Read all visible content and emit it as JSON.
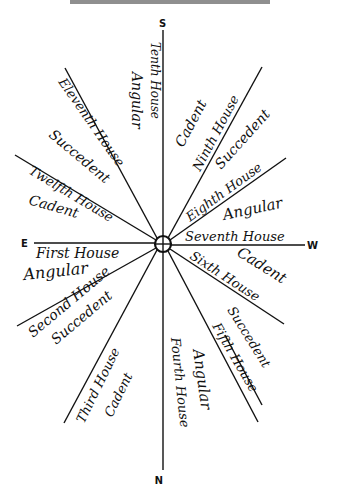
{
  "header": {
    "text": ""
  },
  "compass": {
    "south": "S",
    "north": "N",
    "east": "E",
    "west": "W"
  },
  "houses": [
    {
      "name": "First House",
      "type": "Angular"
    },
    {
      "name": "Second House",
      "type": "Succedent"
    },
    {
      "name": "Third House",
      "type": "Cadent"
    },
    {
      "name": "Fourth House",
      "type": "Angular"
    },
    {
      "name": "Fifth House",
      "type": "Succedent"
    },
    {
      "name": "Sixth House",
      "type": "Cadent"
    },
    {
      "name": "Seventh House",
      "type": "Angular"
    },
    {
      "name": "Eighth House",
      "type": "Succedent"
    },
    {
      "name": "Ninth House",
      "type": "Cadent"
    },
    {
      "name": "Tenth House",
      "type": "Angular"
    },
    {
      "name": "Eleventh House",
      "type": "Succedent"
    },
    {
      "name": "Twelfth House",
      "type": "Cadent"
    }
  ],
  "colors": {
    "ink": "#111111",
    "paper": "#ffffff"
  }
}
